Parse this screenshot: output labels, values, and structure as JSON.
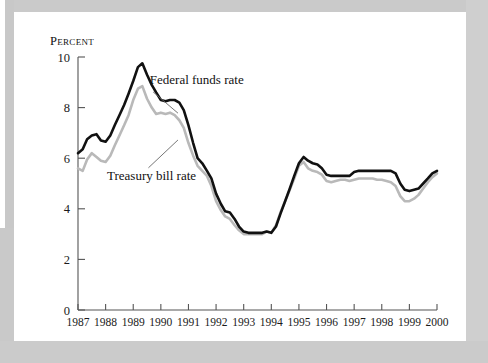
{
  "figure": {
    "unit_label": "Percent",
    "background_color": "#ffffff",
    "mat_color": "#c9c9c9"
  },
  "annotations": {
    "federal_funds": "Federal funds rate",
    "treasury_bill": "Treasury bill rate"
  },
  "chart_data": {
    "type": "line",
    "title": "",
    "subtitle": "",
    "xlabel": "",
    "ylabel": "Percent",
    "ylim": [
      0,
      10
    ],
    "xlim": [
      1987,
      2000
    ],
    "yticks": [
      0,
      2,
      4,
      6,
      8,
      10
    ],
    "ytick_labels": [
      "0",
      "2",
      "4",
      "6",
      "8",
      "10"
    ],
    "xticks": [
      1987,
      1988,
      1989,
      1990,
      1991,
      1992,
      1993,
      1994,
      1995,
      1996,
      1997,
      1998,
      1999,
      2000
    ],
    "xtick_labels": [
      "1987",
      "1988",
      "1989",
      "1990",
      "1991",
      "1992",
      "1993",
      "1994",
      "1995",
      "1996",
      "1997",
      "1998",
      "1999",
      "2000"
    ],
    "grid": false,
    "legend_position": "inline-annotation",
    "series": [
      {
        "name": "Federal funds rate",
        "color": "#111111",
        "line_width": 2.6,
        "x": [
          1987.0,
          1987.17,
          1987.33,
          1987.5,
          1987.67,
          1987.83,
          1988.0,
          1988.17,
          1988.33,
          1988.5,
          1988.67,
          1988.83,
          1989.0,
          1989.17,
          1989.33,
          1989.5,
          1989.67,
          1989.83,
          1990.0,
          1990.17,
          1990.33,
          1990.5,
          1990.67,
          1990.83,
          1991.0,
          1991.17,
          1991.33,
          1991.5,
          1991.67,
          1991.83,
          1992.0,
          1992.17,
          1992.33,
          1992.5,
          1992.67,
          1992.83,
          1993.0,
          1993.17,
          1993.33,
          1993.5,
          1993.67,
          1993.83,
          1994.0,
          1994.17,
          1994.33,
          1994.5,
          1994.67,
          1994.83,
          1995.0,
          1995.17,
          1995.33,
          1995.5,
          1995.67,
          1995.83,
          1996.0,
          1996.17,
          1996.33,
          1996.5,
          1996.67,
          1996.83,
          1997.0,
          1997.17,
          1997.33,
          1997.5,
          1997.67,
          1997.83,
          1998.0,
          1998.17,
          1998.33,
          1998.5,
          1998.67,
          1998.83,
          1999.0,
          1999.17,
          1999.33,
          1999.5,
          1999.67,
          1999.83,
          2000.0
        ],
        "values": [
          6.2,
          6.35,
          6.75,
          6.9,
          6.95,
          6.7,
          6.65,
          6.9,
          7.3,
          7.7,
          8.1,
          8.55,
          9.05,
          9.6,
          9.75,
          9.3,
          8.9,
          8.6,
          8.3,
          8.25,
          8.3,
          8.3,
          8.2,
          7.9,
          7.3,
          6.6,
          6.0,
          5.8,
          5.5,
          5.2,
          4.6,
          4.2,
          3.9,
          3.85,
          3.6,
          3.3,
          3.1,
          3.05,
          3.05,
          3.05,
          3.05,
          3.1,
          3.05,
          3.3,
          3.8,
          4.3,
          4.8,
          5.3,
          5.8,
          6.05,
          5.9,
          5.8,
          5.75,
          5.6,
          5.35,
          5.3,
          5.3,
          5.3,
          5.3,
          5.3,
          5.45,
          5.5,
          5.5,
          5.5,
          5.5,
          5.5,
          5.5,
          5.5,
          5.5,
          5.4,
          5.0,
          4.75,
          4.7,
          4.75,
          4.8,
          5.0,
          5.2,
          5.4,
          5.5
        ]
      },
      {
        "name": "Treasury bill rate",
        "color": "#b9b9b9",
        "line_width": 2.6,
        "x": [
          1987.0,
          1987.17,
          1987.33,
          1987.5,
          1987.67,
          1987.83,
          1988.0,
          1988.17,
          1988.33,
          1988.5,
          1988.67,
          1988.83,
          1989.0,
          1989.17,
          1989.33,
          1989.5,
          1989.67,
          1989.83,
          1990.0,
          1990.17,
          1990.33,
          1990.5,
          1990.67,
          1990.83,
          1991.0,
          1991.17,
          1991.33,
          1991.5,
          1991.67,
          1991.83,
          1992.0,
          1992.17,
          1992.33,
          1992.5,
          1992.67,
          1992.83,
          1993.0,
          1993.17,
          1993.33,
          1993.5,
          1993.67,
          1993.83,
          1994.0,
          1994.17,
          1994.33,
          1994.5,
          1994.67,
          1994.83,
          1995.0,
          1995.17,
          1995.33,
          1995.5,
          1995.67,
          1995.83,
          1996.0,
          1996.17,
          1996.33,
          1996.5,
          1996.67,
          1996.83,
          1997.0,
          1997.17,
          1997.33,
          1997.5,
          1997.67,
          1997.83,
          1998.0,
          1998.17,
          1998.33,
          1998.5,
          1998.67,
          1998.83,
          1999.0,
          1999.17,
          1999.33,
          1999.5,
          1999.67,
          1999.83,
          2000.0
        ],
        "values": [
          5.6,
          5.5,
          5.95,
          6.2,
          6.05,
          5.9,
          5.85,
          6.1,
          6.5,
          6.9,
          7.3,
          7.7,
          8.3,
          8.75,
          8.85,
          8.35,
          8.0,
          7.75,
          7.8,
          7.75,
          7.8,
          7.7,
          7.5,
          7.2,
          6.6,
          6.1,
          5.7,
          5.5,
          5.3,
          4.9,
          4.3,
          3.95,
          3.7,
          3.6,
          3.35,
          3.15,
          3.0,
          3.0,
          3.0,
          3.0,
          3.0,
          3.1,
          3.05,
          3.35,
          3.85,
          4.3,
          4.75,
          5.2,
          5.7,
          5.85,
          5.6,
          5.5,
          5.45,
          5.35,
          5.1,
          5.05,
          5.1,
          5.15,
          5.15,
          5.1,
          5.15,
          5.2,
          5.2,
          5.2,
          5.2,
          5.15,
          5.15,
          5.1,
          5.05,
          4.9,
          4.5,
          4.3,
          4.3,
          4.4,
          4.55,
          4.8,
          5.05,
          5.25,
          5.4
        ]
      }
    ],
    "annotations": [
      {
        "text": "Federal funds rate",
        "x": 1989.6,
        "y": 8.95
      },
      {
        "text": "Treasury bill rate",
        "x": 1988.05,
        "y": 5.15
      }
    ]
  }
}
